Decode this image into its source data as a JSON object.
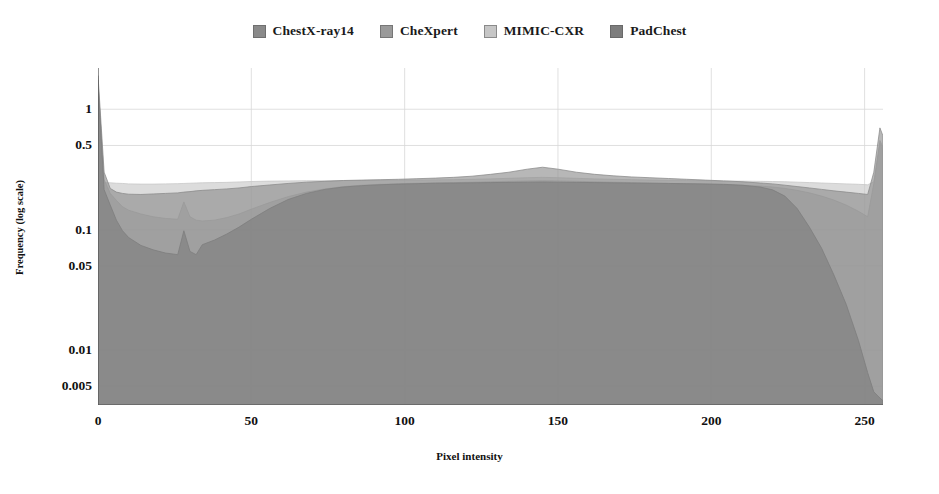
{
  "chart_data": {
    "type": "area",
    "title": "",
    "xlabel": "Pixel intensity",
    "ylabel": "Frequency (log scale)",
    "xlim": [
      0,
      256
    ],
    "ylim": [
      0.0035,
      2.2
    ],
    "yscale": "log",
    "grid": true,
    "legend_position": "top-center",
    "xticks": [
      0,
      50,
      100,
      150,
      200,
      250
    ],
    "xtick_labels": [
      "0",
      "50",
      "100",
      "150",
      "200",
      "250"
    ],
    "yticks": [
      1,
      0.5,
      0.1,
      0.05,
      0.01,
      0.005
    ],
    "ytick_labels": [
      "1",
      "0.5",
      "0.1",
      "0.05",
      "0.01",
      "0.005"
    ],
    "x": [
      0,
      2,
      4,
      6,
      8,
      10,
      14,
      18,
      22,
      26,
      28,
      30,
      32,
      34,
      38,
      42,
      46,
      50,
      56,
      62,
      68,
      74,
      80,
      86,
      92,
      98,
      104,
      110,
      116,
      122,
      128,
      134,
      140,
      145,
      150,
      156,
      162,
      168,
      174,
      180,
      186,
      192,
      198,
      204,
      210,
      216,
      220,
      224,
      228,
      232,
      236,
      240,
      244,
      248,
      251,
      253,
      255,
      256
    ],
    "series": [
      {
        "name": "ChestX-ray14",
        "color": "#8a8a8a",
        "values": [
          1.9,
          0.3,
          0.22,
          0.205,
          0.2,
          0.197,
          0.196,
          0.198,
          0.2,
          0.202,
          0.205,
          0.207,
          0.21,
          0.212,
          0.215,
          0.218,
          0.222,
          0.228,
          0.235,
          0.242,
          0.248,
          0.252,
          0.256,
          0.258,
          0.26,
          0.262,
          0.265,
          0.268,
          0.272,
          0.278,
          0.288,
          0.3,
          0.318,
          0.33,
          0.318,
          0.3,
          0.288,
          0.28,
          0.274,
          0.27,
          0.266,
          0.262,
          0.258,
          0.254,
          0.25,
          0.244,
          0.24,
          0.234,
          0.228,
          0.222,
          0.216,
          0.21,
          0.205,
          0.2,
          0.196,
          0.3,
          0.7,
          0.6
        ]
      },
      {
        "name": "CheXpert",
        "color": "#9a9a9a",
        "values": [
          1.6,
          0.26,
          0.2,
          0.175,
          0.155,
          0.145,
          0.135,
          0.128,
          0.124,
          0.122,
          0.17,
          0.128,
          0.12,
          0.118,
          0.12,
          0.126,
          0.135,
          0.148,
          0.168,
          0.188,
          0.205,
          0.218,
          0.228,
          0.234,
          0.238,
          0.241,
          0.243,
          0.245,
          0.246,
          0.248,
          0.25,
          0.252,
          0.254,
          0.255,
          0.254,
          0.252,
          0.25,
          0.248,
          0.246,
          0.244,
          0.242,
          0.24,
          0.238,
          0.236,
          0.234,
          0.23,
          0.226,
          0.22,
          0.212,
          0.202,
          0.19,
          0.176,
          0.16,
          0.142,
          0.128,
          0.24,
          0.55,
          0.48
        ]
      },
      {
        "name": "MIMIC-CXR",
        "color": "#c6c6c6",
        "values": [
          1.4,
          0.245,
          0.245,
          0.243,
          0.242,
          0.24,
          0.239,
          0.239,
          0.24,
          0.241,
          0.242,
          0.243,
          0.244,
          0.245,
          0.246,
          0.247,
          0.249,
          0.251,
          0.253,
          0.254,
          0.255,
          0.255,
          0.256,
          0.256,
          0.257,
          0.257,
          0.258,
          0.259,
          0.26,
          0.262,
          0.264,
          0.267,
          0.27,
          0.272,
          0.27,
          0.267,
          0.264,
          0.262,
          0.26,
          0.258,
          0.257,
          0.256,
          0.255,
          0.254,
          0.253,
          0.252,
          0.251,
          0.25,
          0.248,
          0.246,
          0.244,
          0.242,
          0.24,
          0.238,
          0.236,
          0.25,
          0.52,
          0.45
        ]
      },
      {
        "name": "PadChest",
        "color": "#7d7d7d",
        "values": [
          1.75,
          0.215,
          0.16,
          0.12,
          0.098,
          0.086,
          0.074,
          0.068,
          0.064,
          0.062,
          0.098,
          0.066,
          0.062,
          0.075,
          0.082,
          0.092,
          0.105,
          0.122,
          0.15,
          0.178,
          0.2,
          0.216,
          0.226,
          0.232,
          0.236,
          0.239,
          0.241,
          0.243,
          0.244,
          0.245,
          0.246,
          0.247,
          0.248,
          0.249,
          0.248,
          0.247,
          0.246,
          0.245,
          0.244,
          0.243,
          0.242,
          0.241,
          0.24,
          0.238,
          0.234,
          0.226,
          0.214,
          0.19,
          0.15,
          0.105,
          0.07,
          0.042,
          0.024,
          0.012,
          0.0065,
          0.0045,
          0.004,
          0.0038
        ]
      }
    ]
  },
  "legend": {
    "items": [
      {
        "label": "ChestX-ray14",
        "color": "#8a8a8a"
      },
      {
        "label": "CheXpert",
        "color": "#9a9a9a"
      },
      {
        "label": "MIMIC-CXR",
        "color": "#c6c6c6"
      },
      {
        "label": "PadChest",
        "color": "#7d7d7d"
      }
    ]
  }
}
